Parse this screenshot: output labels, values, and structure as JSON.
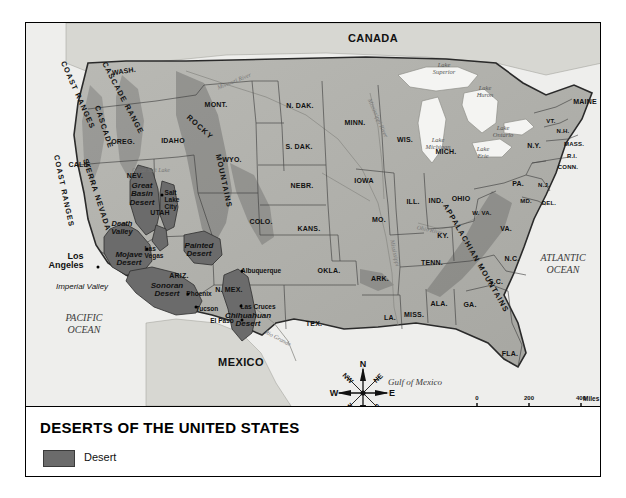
{
  "caption": {
    "title": "DESERTS OF THE UNITED STATES",
    "legend": {
      "desert_label": "Desert",
      "desert_color": "#6b6b6b"
    }
  },
  "map": {
    "countries": [
      {
        "name": "CANADA",
        "x": 347,
        "y": 15
      },
      {
        "name": "MEXICO",
        "x": 215,
        "y": 339
      }
    ],
    "oceans": [
      {
        "name": "PACIFIC\nOCEAN",
        "x": 58,
        "y": 300
      },
      {
        "name": "ATLANTIC\nOCEAN",
        "x": 537,
        "y": 240
      }
    ],
    "gulf": {
      "name": "Gulf of Mexico",
      "x": 389,
      "y": 359
    },
    "lakes": [
      {
        "name": "Lake\nSuperior",
        "x": 418,
        "y": 45
      },
      {
        "name": "Lake\nHuron",
        "x": 459,
        "y": 68
      },
      {
        "name": "Lake\nMichigan",
        "x": 412,
        "y": 120
      },
      {
        "name": "Lake\nOntario",
        "x": 477,
        "y": 108
      },
      {
        "name": "Lake\nErie",
        "x": 457,
        "y": 129
      }
    ],
    "rivers": [
      {
        "name": "Missouri River",
        "x": 208,
        "y": 58,
        "rot": -22
      },
      {
        "name": "Mississippi River",
        "x": 352,
        "y": 95,
        "rot": 66
      },
      {
        "name": "Mississippi",
        "x": 369,
        "y": 230,
        "rot": 78
      },
      {
        "name": "Ohio River",
        "x": 404,
        "y": 207,
        "rot": 12
      },
      {
        "name": "Rio Grande",
        "x": 252,
        "y": 315,
        "rot": 28
      },
      {
        "name": "Great Salt Lake",
        "x": 125,
        "y": 147,
        "rot": 0
      }
    ],
    "ranges": [
      {
        "name": "COAST RANGES",
        "x": 52,
        "y": 72,
        "rot": 66
      },
      {
        "name": "CASCADE RANGE",
        "x": 97,
        "y": 75,
        "rot": 62
      },
      {
        "name": "CASCADE",
        "x": 78,
        "y": 104,
        "rot": 72
      },
      {
        "name": "COAST RANGES",
        "x": 38,
        "y": 168,
        "rot": 78
      },
      {
        "name": "SIERRA NEVADA",
        "x": 71,
        "y": 172,
        "rot": 72
      },
      {
        "name": "ROCKY",
        "x": 174,
        "y": 104,
        "rot": 42
      },
      {
        "name": "MOUNTAINS",
        "x": 198,
        "y": 158,
        "rot": 78
      },
      {
        "name": "APPALACHIAN MOUNTAINS",
        "x": 450,
        "y": 235,
        "rot": 60
      }
    ],
    "deserts": [
      {
        "name": "Great\nBasin\nDesert",
        "x": 116,
        "y": 172
      },
      {
        "name": "Mojave\nDesert",
        "x": 103,
        "y": 236
      },
      {
        "name": "Sonoran\nDesert",
        "x": 141,
        "y": 267
      },
      {
        "name": "Painted\nDesert",
        "x": 173,
        "y": 227
      },
      {
        "name": "Chihuahuan\nDesert",
        "x": 222,
        "y": 297
      }
    ],
    "valleys": [
      {
        "name": "Death\nValley",
        "x": 96,
        "y": 205
      },
      {
        "name": "Imperial Valley",
        "x": 56,
        "y": 263,
        "italic_plain": true
      }
    ],
    "big_cities": [
      {
        "name": "Los\nAngeles",
        "x": 40,
        "y": 238,
        "dot_x": 72,
        "dot_y": 244
      }
    ],
    "cities": [
      {
        "name": "Salt\nLake\nCity",
        "x": 146,
        "y": 177,
        "dot_x": 136,
        "dot_y": 172
      },
      {
        "name": "Las\nVegas",
        "x": 128,
        "y": 230,
        "dot_x": 121,
        "dot_y": 226
      },
      {
        "name": "Phoenix",
        "x": 173,
        "y": 271,
        "dot_x": 162,
        "dot_y": 271
      },
      {
        "name": "Tucson",
        "x": 181,
        "y": 286,
        "dot_x": 170,
        "dot_y": 284
      },
      {
        "name": "Albuquerque",
        "x": 235,
        "y": 248,
        "dot_x": 216,
        "dot_y": 248
      },
      {
        "name": "Las Cruces",
        "x": 232,
        "y": 284,
        "dot_x": 215,
        "dot_y": 283
      },
      {
        "name": "El Paso",
        "x": 196,
        "y": 298,
        "dot_x": 216,
        "dot_y": 297
      }
    ],
    "states": [
      {
        "name": "WASH.",
        "x": 98,
        "y": 48,
        "size": "sm",
        "rot": -8
      },
      {
        "name": "OREG.",
        "x": 97,
        "y": 118,
        "size": "sm"
      },
      {
        "name": "CALIF.",
        "x": 54,
        "y": 141,
        "size": "sm"
      },
      {
        "name": "IDAHO",
        "x": 147,
        "y": 117,
        "size": "sm"
      },
      {
        "name": "NEV.",
        "x": 109,
        "y": 152,
        "size": "sm"
      },
      {
        "name": "UTAH",
        "x": 134,
        "y": 189,
        "size": "sm"
      },
      {
        "name": "ARIZ.",
        "x": 153,
        "y": 252,
        "size": "sm"
      },
      {
        "name": "MONT.",
        "x": 190,
        "y": 81,
        "size": "sm"
      },
      {
        "name": "WYO.",
        "x": 206,
        "y": 136,
        "size": "sm"
      },
      {
        "name": "COLO.",
        "x": 235,
        "y": 198,
        "size": "sm"
      },
      {
        "name": "N. MEX.",
        "x": 203,
        "y": 266,
        "size": "sm"
      },
      {
        "name": "N. DAK.",
        "x": 274,
        "y": 82,
        "size": "sm"
      },
      {
        "name": "S. DAK.",
        "x": 273,
        "y": 123,
        "size": "sm"
      },
      {
        "name": "NEBR.",
        "x": 276,
        "y": 162,
        "size": "sm"
      },
      {
        "name": "KANS.",
        "x": 283,
        "y": 205,
        "size": "sm"
      },
      {
        "name": "OKLA.",
        "x": 303,
        "y": 247,
        "size": "sm"
      },
      {
        "name": "TEX.",
        "x": 288,
        "y": 300,
        "size": "sm"
      },
      {
        "name": "MINN.",
        "x": 329,
        "y": 99,
        "size": "sm"
      },
      {
        "name": "IOWA",
        "x": 338,
        "y": 157,
        "size": "sm"
      },
      {
        "name": "MO.",
        "x": 353,
        "y": 196,
        "size": "sm"
      },
      {
        "name": "ARK.",
        "x": 354,
        "y": 255,
        "size": "sm"
      },
      {
        "name": "LA.",
        "x": 364,
        "y": 294,
        "size": "sm"
      },
      {
        "name": "WIS.",
        "x": 379,
        "y": 116,
        "size": "sm"
      },
      {
        "name": "ILL.",
        "x": 387,
        "y": 178,
        "size": "sm"
      },
      {
        "name": "IND.",
        "x": 410,
        "y": 177,
        "size": "sm"
      },
      {
        "name": "MICH.",
        "x": 420,
        "y": 128,
        "size": "sm"
      },
      {
        "name": "OHIO",
        "x": 435,
        "y": 175,
        "size": "sm"
      },
      {
        "name": "MISS.",
        "x": 388,
        "y": 291,
        "size": "sm"
      },
      {
        "name": "ALA.",
        "x": 413,
        "y": 280,
        "size": "sm"
      },
      {
        "name": "TENN.",
        "x": 406,
        "y": 239,
        "size": "sm"
      },
      {
        "name": "KY.",
        "x": 417,
        "y": 212,
        "size": "sm"
      },
      {
        "name": "GA.",
        "x": 444,
        "y": 281,
        "size": "sm"
      },
      {
        "name": "FLA.",
        "x": 484,
        "y": 330,
        "size": "sm"
      },
      {
        "name": "S.C.",
        "x": 470,
        "y": 258,
        "size": "sm"
      },
      {
        "name": "N.C.",
        "x": 486,
        "y": 235,
        "size": "sm"
      },
      {
        "name": "VA.",
        "x": 480,
        "y": 205,
        "size": "sm"
      },
      {
        "name": "W. VA.",
        "x": 456,
        "y": 190,
        "size": "xs"
      },
      {
        "name": "PA.",
        "x": 492,
        "y": 160,
        "size": "sm"
      },
      {
        "name": "MD.",
        "x": 500,
        "y": 178,
        "size": "xs"
      },
      {
        "name": "DEL.",
        "x": 523,
        "y": 180,
        "size": "xs"
      },
      {
        "name": "N.J.",
        "x": 518,
        "y": 162,
        "size": "xs"
      },
      {
        "name": "N.Y.",
        "x": 508,
        "y": 122,
        "size": "sm"
      },
      {
        "name": "CONN.",
        "x": 542,
        "y": 144,
        "size": "xs"
      },
      {
        "name": "R.I.",
        "x": 546,
        "y": 133,
        "size": "xs"
      },
      {
        "name": "MASS.",
        "x": 548,
        "y": 121,
        "size": "xs"
      },
      {
        "name": "N.H.",
        "x": 537,
        "y": 108,
        "size": "xs"
      },
      {
        "name": "VT.",
        "x": 525,
        "y": 98,
        "size": "xs"
      },
      {
        "name": "MAINE",
        "x": 559,
        "y": 78,
        "size": "sm"
      }
    ]
  },
  "compass": {
    "points": [
      {
        "label": "N",
        "card": true,
        "ang": 0
      },
      {
        "label": "NE",
        "card": false,
        "ang": 45
      },
      {
        "label": "E",
        "card": true,
        "ang": 90
      },
      {
        "label": "SE",
        "card": false,
        "ang": 135
      },
      {
        "label": "S",
        "card": true,
        "ang": 180
      },
      {
        "label": "SW",
        "card": false,
        "ang": 225
      },
      {
        "label": "W",
        "card": true,
        "ang": 270
      },
      {
        "label": "NW",
        "card": false,
        "ang": 315
      }
    ]
  },
  "scale": {
    "miles": {
      "unit": "Miles",
      "ticks": [
        "0",
        "200",
        "400"
      ]
    },
    "kilometers": {
      "unit": "Kilometers",
      "ticks": [
        "0",
        "200",
        "400",
        "600"
      ]
    }
  }
}
